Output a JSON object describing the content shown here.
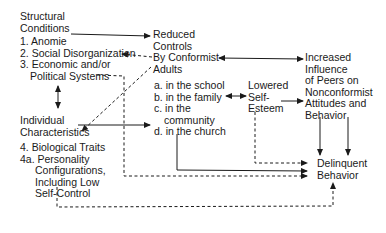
{
  "diagram": {
    "type": "causal-flow",
    "colors": {
      "line": "#1a1a1a",
      "text": "#1a1a1a",
      "background": "#ffffff"
    },
    "nodes": {
      "structural": {
        "title": [
          "Structural",
          "Conditions"
        ],
        "items": [
          "1. Anomie",
          "2. Social Disorganization",
          "3. Economic and/or",
          "Political Systems"
        ]
      },
      "reduced_controls": {
        "title": [
          "Reduced",
          "Controls",
          "By Conformist",
          "Adults"
        ],
        "items": [
          "a. in the school",
          "b. in the family",
          "c. in the",
          "community",
          "d. in the church"
        ]
      },
      "individual": {
        "title": [
          "Individual",
          "Characteristics"
        ],
        "items": [
          "4. Biological Traits",
          "4a. Personality",
          "Configurations,",
          "Including Low",
          "Self-Control"
        ]
      },
      "self_esteem": {
        "lines": [
          "Lowered",
          "Self-",
          "Esteem"
        ]
      },
      "peer_influence": {
        "lines": [
          "Increased",
          "Influence",
          "of Peers on",
          "Nonconformist",
          "Attitudes and",
          "Behavior"
        ]
      },
      "delinquent": {
        "lines": [
          "Delinquent",
          "Behavior"
        ]
      }
    },
    "edges": [
      {
        "from": "Structural Conditions",
        "to": "Reduced Controls",
        "style": "solid",
        "direction": "forward"
      },
      {
        "from": "Reduced Controls By Conformist Adults",
        "to": "2. Social Disorganization",
        "style": "dashed",
        "direction": "forward"
      },
      {
        "from": "Reduced Controls By Conformist Adults",
        "to": "Increased Influence of Peers",
        "style": "solid",
        "direction": "both"
      },
      {
        "from": "Structural Conditions",
        "to": "Individual Characteristics",
        "style": "solid",
        "direction": "both"
      },
      {
        "from": "Reduced Controls By Conformist Adults",
        "to": "Individual Characteristics",
        "style": "dashed",
        "direction": "forward"
      },
      {
        "from": "Individual Characteristics",
        "to": "Reduced Controls (c. community)",
        "style": "solid",
        "direction": "forward"
      },
      {
        "from": "b. in the family",
        "to": "Lowered Self-Esteem",
        "style": "solid",
        "direction": "both"
      },
      {
        "from": "Lowered Self-Esteem",
        "to": "Increased Influence of Peers",
        "style": "solid",
        "direction": "forward"
      },
      {
        "from": "Increased Influence of Peers",
        "to": "Delinquent Behavior",
        "style": "solid",
        "direction": "forward",
        "count": 2
      },
      {
        "from": "Lowered Self-Esteem",
        "to": "Delinquent Behavior",
        "style": "dashed",
        "direction": "forward"
      },
      {
        "from": "d. in the church",
        "to": "Delinquent Behavior",
        "style": "solid",
        "direction": "forward"
      },
      {
        "from": "3. Political Systems",
        "to": "Delinquent Behavior",
        "style": "dashed",
        "direction": "forward"
      },
      {
        "from": "4a. Self-Control",
        "to": "Delinquent Behavior",
        "style": "dashed",
        "direction": "forward"
      }
    ]
  }
}
